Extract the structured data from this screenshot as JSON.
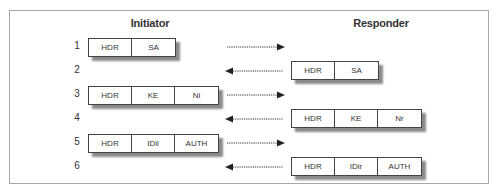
{
  "diagram": {
    "initiator_label": "Initiator",
    "responder_label": "Responder",
    "rows": [
      {
        "num": "1",
        "direction": "right",
        "side": "initiator",
        "fields": [
          "HDR",
          "SA"
        ]
      },
      {
        "num": "2",
        "direction": "left",
        "side": "responder",
        "fields": [
          "HDR",
          "SA"
        ]
      },
      {
        "num": "3",
        "direction": "right",
        "side": "initiator",
        "fields": [
          "HDR",
          "KE",
          "Ni"
        ]
      },
      {
        "num": "4",
        "direction": "left",
        "side": "responder",
        "fields": [
          "HDR",
          "KE",
          "Nr"
        ]
      },
      {
        "num": "5",
        "direction": "right",
        "side": "initiator",
        "fields": [
          "HDR",
          "IDii",
          "AUTH"
        ]
      },
      {
        "num": "6",
        "direction": "left",
        "side": "responder",
        "fields": [
          "HDR",
          "IDir",
          "AUTH"
        ]
      }
    ],
    "colors": {
      "border": "#444444",
      "shadow": "#8a8a8a",
      "frame": "#a8a8a8",
      "text": "#333333"
    }
  }
}
